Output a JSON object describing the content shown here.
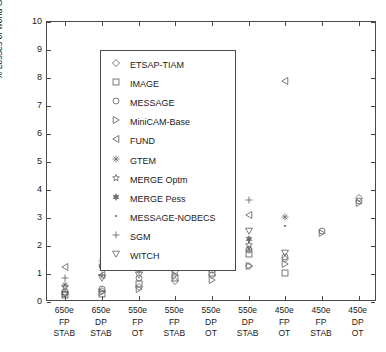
{
  "chart_data": {
    "type": "scatter",
    "title": "",
    "xlabel": "",
    "ylabel": "% Losses of world GDP, in NPV",
    "ylim": [
      0,
      10
    ],
    "yticks": [
      0,
      1,
      2,
      3,
      4,
      5,
      6,
      7,
      8,
      9,
      10
    ],
    "grid": false,
    "legend_position": "upper-left-inside",
    "categories": [
      {
        "line1": "650e",
        "line2": "FP",
        "line3": "STAB"
      },
      {
        "line1": "650e",
        "line2": "DP",
        "line3": "STAB"
      },
      {
        "line1": "550e",
        "line2": "FP",
        "line3": "OT"
      },
      {
        "line1": "550e",
        "line2": "FP",
        "line3": "STAB"
      },
      {
        "line1": "550e",
        "line2": "DP",
        "line3": "OT"
      },
      {
        "line1": "550e",
        "line2": "DP",
        "line3": "STAB"
      },
      {
        "line1": "450e",
        "line2": "FP",
        "line3": "OT"
      },
      {
        "line1": "450e",
        "line2": "FP",
        "line3": "STAB"
      },
      {
        "line1": "450e",
        "line2": "DP",
        "line3": "OT"
      }
    ],
    "series": [
      {
        "name": "ETSAP-TIAM",
        "marker": "diamond",
        "points": [
          [
            1,
            0.3
          ],
          [
            2,
            0.4
          ],
          [
            3,
            0.55
          ],
          [
            4,
            0.75
          ],
          [
            5,
            0.95
          ],
          [
            6,
            1.3
          ],
          [
            7,
            1.55
          ],
          [
            9,
            3.7
          ]
        ]
      },
      {
        "name": "IMAGE",
        "marker": "square",
        "points": [
          [
            1,
            0.25
          ],
          [
            2,
            0.3
          ],
          [
            3,
            0.65
          ],
          [
            4,
            0.85
          ],
          [
            5,
            1.05
          ],
          [
            6,
            1.7
          ],
          [
            7,
            1.05
          ]
        ]
      },
      {
        "name": "MESSAGE",
        "marker": "circle",
        "points": [
          [
            1,
            0.35
          ],
          [
            2,
            0.45
          ],
          [
            3,
            0.85
          ],
          [
            4,
            1.1
          ],
          [
            5,
            1.15
          ],
          [
            6,
            1.85
          ],
          [
            7,
            1.6
          ],
          [
            8,
            2.55
          ],
          [
            9,
            3.6
          ]
        ]
      },
      {
        "name": "MiniCAM-Base",
        "marker": "triangle-right",
        "points": [
          [
            1,
            0.3
          ],
          [
            2,
            0.35
          ],
          [
            3,
            0.45
          ],
          [
            4,
            0.95
          ],
          [
            5,
            0.8
          ],
          [
            6,
            1.3
          ],
          [
            7,
            1.35
          ],
          [
            8,
            2.45
          ],
          [
            9,
            3.55
          ]
        ]
      },
      {
        "name": "FUND",
        "marker": "triangle-left",
        "points": [
          [
            1,
            1.25
          ],
          [
            2,
            0.95
          ],
          [
            3,
            1.95
          ],
          [
            5,
            2.65
          ],
          [
            6,
            3.1
          ],
          [
            7,
            7.9
          ]
        ]
      },
      {
        "name": "GTEM",
        "marker": "asterisk",
        "points": [
          [
            1,
            0.6
          ],
          [
            2,
            1.45
          ],
          [
            3,
            1.45
          ],
          [
            5,
            1.7
          ],
          [
            6,
            1.9
          ],
          [
            7,
            3.05
          ]
        ]
      },
      {
        "name": "MERGE Optm",
        "marker": "star-open",
        "points": [
          [
            1,
            0.55
          ],
          [
            2,
            1.25
          ],
          [
            3,
            1.45
          ],
          [
            4,
            1.55
          ],
          [
            5,
            1.9
          ],
          [
            6,
            2.05
          ]
        ]
      },
      {
        "name": "MERGE Pess",
        "marker": "star-six",
        "points": [
          [
            2,
            1.3
          ],
          [
            3,
            1.5
          ],
          [
            4,
            1.6
          ],
          [
            5,
            1.95
          ],
          [
            6,
            2.25
          ]
        ]
      },
      {
        "name": "MESSAGE-NOBECS",
        "marker": "dot",
        "points": [
          [
            4,
            2.05
          ],
          [
            6,
            2.15
          ],
          [
            7,
            2.7
          ]
        ]
      },
      {
        "name": "SGM",
        "marker": "plus",
        "points": [
          [
            1,
            0.85
          ],
          [
            2,
            0.95
          ],
          [
            3,
            1.1
          ],
          [
            4,
            2.45
          ],
          [
            5,
            3.55
          ],
          [
            6,
            3.65
          ]
        ]
      },
      {
        "name": "WITCH",
        "marker": "triangle-down",
        "points": [
          [
            1,
            0.3
          ],
          [
            2,
            0.85
          ],
          [
            3,
            0.95
          ],
          [
            4,
            1.2
          ],
          [
            5,
            1.95
          ],
          [
            6,
            2.55
          ],
          [
            7,
            1.75
          ]
        ]
      }
    ]
  },
  "legend": {
    "items": [
      {
        "label": "ETSAP-TIAM",
        "marker": "diamond"
      },
      {
        "label": "IMAGE",
        "marker": "square"
      },
      {
        "label": "MESSAGE",
        "marker": "circle"
      },
      {
        "label": "MiniCAM-Base",
        "marker": "triangle-right"
      },
      {
        "label": "FUND",
        "marker": "triangle-left"
      },
      {
        "label": "GTEM",
        "marker": "asterisk"
      },
      {
        "label": "MERGE Optm",
        "marker": "star-open"
      },
      {
        "label": "MERGE Pess",
        "marker": "star-six"
      },
      {
        "label": "MESSAGE-NOBECS",
        "marker": "dot"
      },
      {
        "label": "SGM",
        "marker": "plus"
      },
      {
        "label": "WITCH",
        "marker": "triangle-down"
      }
    ]
  },
  "colors": {
    "axis": "#4a4a4a",
    "marker": "#6b6b6b",
    "text": "#1a1a1a"
  }
}
